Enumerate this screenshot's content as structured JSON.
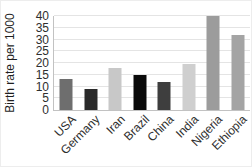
{
  "chart_data": {
    "type": "bar",
    "title": "",
    "xlabel": "",
    "ylabel": "Birth rate per 1000",
    "categories": [
      "USA",
      "Germany",
      "Iran",
      "Brazil",
      "China",
      "India",
      "Nigeria",
      "Ethiopia"
    ],
    "values": [
      13,
      9,
      18,
      15,
      12,
      19.5,
      40,
      32
    ],
    "bar_colors": [
      "#6e6e6e",
      "#2a2a2a",
      "#c8c8c8",
      "#0a0a0a",
      "#3e3e3e",
      "#cfcfcf",
      "#9c9c9c",
      "#a4a4a4"
    ],
    "ylim": [
      0,
      40
    ],
    "yticks": [
      0,
      5,
      10,
      15,
      20,
      25,
      30,
      35,
      40
    ],
    "grid": true,
    "legend": false
  },
  "colors": {
    "background": "#ffffff",
    "gridline": "#e4e4e4",
    "axis_line": "#c2c2c2",
    "tick_label": "#2e2e2e",
    "axis_title": "#1f1f1f"
  }
}
